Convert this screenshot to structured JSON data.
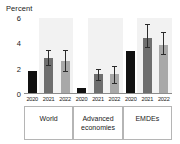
{
  "chart_data": {
    "type": "bar",
    "title": "",
    "subtitle": "",
    "ylabel": "Percent",
    "xlabel": "",
    "ylim": [
      0,
      6
    ],
    "yticks": [
      0,
      2,
      4,
      6
    ],
    "ytick_labels": [
      "0",
      "2",
      "4",
      "6"
    ],
    "grid": false,
    "legend": "none",
    "categories": [
      "World",
      "Advanced economies",
      "EMDEs"
    ],
    "category_labels": [
      "World",
      "Advanced\neconomies",
      "EMDEs"
    ],
    "x": [
      "2020",
      "2021",
      "2022"
    ],
    "series": [
      {
        "name": "2020",
        "color": "#111111",
        "values": [
          1.85,
          0.5,
          3.4
        ],
        "err_low": [
          null,
          null,
          null
        ],
        "err_high": [
          null,
          null,
          null
        ]
      },
      {
        "name": "2021",
        "color": "#6e6e6e",
        "values": [
          2.85,
          1.55,
          4.4
        ],
        "err_low": [
          2.3,
          1.1,
          3.7
        ],
        "err_high": [
          3.45,
          2.0,
          5.5
        ]
      },
      {
        "name": "2022",
        "color": "#a8a8a8",
        "values": [
          2.6,
          1.55,
          3.9
        ],
        "err_low": [
          1.8,
          0.85,
          3.15
        ],
        "err_high": [
          3.45,
          2.25,
          4.9
        ]
      }
    ],
    "bars": [
      {
        "group": "World",
        "year": "2020",
        "value": 1.85,
        "color": "#111111",
        "err_low": null,
        "err_high": null
      },
      {
        "group": "World",
        "year": "2021",
        "value": 2.85,
        "color": "#6e6e6e",
        "err_low": 2.3,
        "err_high": 3.45
      },
      {
        "group": "World",
        "year": "2022",
        "value": 2.6,
        "color": "#a8a8a8",
        "err_low": 1.8,
        "err_high": 3.45
      },
      {
        "group": "Advanced economies",
        "year": "2020",
        "value": 0.5,
        "color": "#111111",
        "err_low": null,
        "err_high": null
      },
      {
        "group": "Advanced economies",
        "year": "2021",
        "value": 1.55,
        "color": "#6e6e6e",
        "err_low": 1.1,
        "err_high": 2.0
      },
      {
        "group": "Advanced economies",
        "year": "2022",
        "value": 1.55,
        "color": "#a8a8a8",
        "err_low": 0.85,
        "err_high": 2.25
      },
      {
        "group": "EMDEs",
        "year": "2020",
        "value": 3.4,
        "color": "#111111",
        "err_low": null,
        "err_high": null
      },
      {
        "group": "EMDEs",
        "year": "2021",
        "value": 4.4,
        "color": "#6e6e6e",
        "err_low": 3.7,
        "err_high": 5.5
      },
      {
        "group": "EMDEs",
        "year": "2022",
        "value": 3.9,
        "color": "#a8a8a8",
        "err_low": 3.15,
        "err_high": 4.9
      }
    ]
  },
  "colors": {
    "bar_2020": "#111111",
    "bar_2021": "#6e6e6e",
    "bar_2022": "#a8a8a8",
    "panel_background": "#f2f2f2",
    "error_bar": "#2b2b2b",
    "axis": "#8c8c8c",
    "text": "#1a1a1a",
    "background": "#ffffff"
  }
}
